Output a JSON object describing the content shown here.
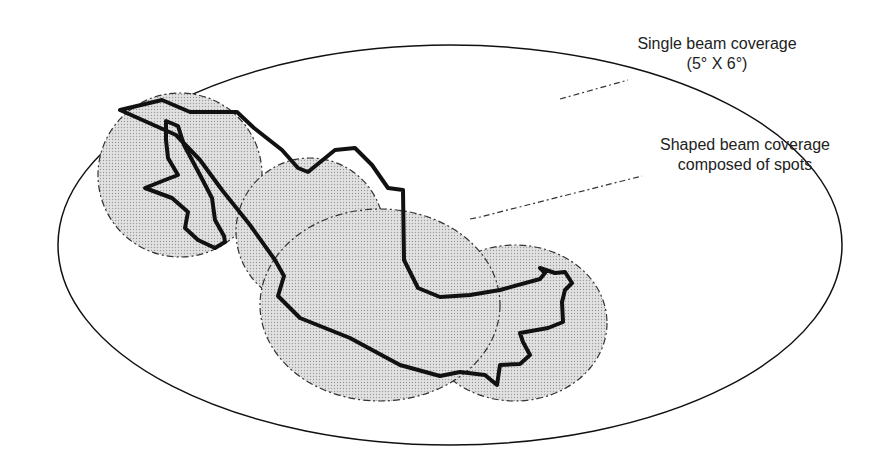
{
  "diagram": {
    "labels": {
      "single_beam_line1": "Single beam coverage",
      "single_beam_line2": "(5° X 6°)",
      "shaped_beam_line1": "Shaped beam coverage",
      "shaped_beam_line2": "composed of spots"
    },
    "colors": {
      "stroke": "#111111",
      "spot_fill": "#d4d4d4",
      "background": "#ffffff"
    },
    "elements": {
      "single_beam_ellipse": "Large ellipse representing single 5°×6° beam coverage",
      "spot_beams": [
        "spot-1",
        "spot-2",
        "spot-3",
        "spot-4",
        "spot-5"
      ],
      "country_outline": "Mexico outline"
    }
  }
}
